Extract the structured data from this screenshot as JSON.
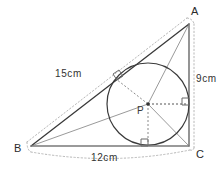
{
  "figure": {
    "kind": "geometry-diagram",
    "background_color": "#ffffff",
    "stroke_color": "#333333",
    "gray_stroke_color": "#999999",
    "dotted_color": "#b0b0b0",
    "vertices": [
      {
        "id": "A",
        "label": "A",
        "x": 189,
        "y": 24,
        "label_x": 191,
        "label_y": 15
      },
      {
        "id": "B",
        "label": "B",
        "x": 31,
        "y": 146,
        "label_x": 15,
        "label_y": 152
      },
      {
        "id": "C",
        "label": "C",
        "x": 189,
        "y": 146,
        "label_x": 195,
        "label_y": 157
      }
    ],
    "incircle": {
      "center_label": "P",
      "center_x": 148,
      "center_y": 104,
      "radius": 41,
      "label_x": 138,
      "label_y": 113,
      "center_dot_radius": 1.8
    },
    "dimensions": [
      {
        "id": "side-ab",
        "label": "15cm",
        "label_x": 55,
        "label_y": 77
      },
      {
        "id": "side-ac",
        "label": "9cm",
        "label_x": 196,
        "label_y": 82
      },
      {
        "id": "side-bc",
        "label": "12cm",
        "label_x": 91,
        "label_y": 160
      }
    ],
    "right_angle_markers": [
      {
        "id": "tangent-ab",
        "note": "right angle at tangent point on AB"
      },
      {
        "id": "tangent-ac",
        "note": "right angle at tangent point on AC"
      },
      {
        "id": "tangent-bc",
        "note": "right angle at tangent point on BC"
      }
    ],
    "segments": [
      {
        "id": "ab",
        "note": "hypotenuse from B to A"
      },
      {
        "id": "ac",
        "note": "vertical leg from A to C"
      },
      {
        "id": "bc",
        "note": "horizontal leg from B to C"
      },
      {
        "id": "pa",
        "note": "gray segment centre to A"
      },
      {
        "id": "pb",
        "note": "gray segment centre to B"
      },
      {
        "id": "pc",
        "note": "gray segment centre to C"
      },
      {
        "id": "radius-ab",
        "note": "dashed radius to AB tangent point"
      },
      {
        "id": "radius-ac",
        "note": "dashed radius to AC tangent point"
      },
      {
        "id": "radius-bc",
        "note": "dashed radius to BC tangent point"
      }
    ]
  }
}
